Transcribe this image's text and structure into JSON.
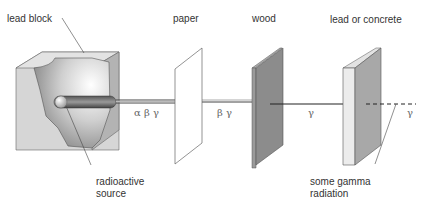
{
  "diagram": {
    "labels": {
      "lead_block": "lead block",
      "paper": "paper",
      "wood": "wood",
      "lead_or_concrete": "lead or concrete",
      "radioactive_source_line1": "radioactive",
      "radioactive_source_line2": "source",
      "some_gamma_line1": "some gamma",
      "some_gamma_line2": "radiation"
    },
    "beam_labels": {
      "after_source": "α β γ",
      "after_paper": "β γ",
      "after_wood": "γ",
      "after_lead": "γ"
    },
    "colors": {
      "lead_block_face": "#d9d9d9",
      "lead_block_side": "#a8a8a8",
      "wood_front": "#8c8c8c",
      "wood_edge": "#a0a0a0",
      "lead_front": "#e8e8e8",
      "lead_side": "#a6a6a6",
      "beam": "#222222"
    }
  }
}
